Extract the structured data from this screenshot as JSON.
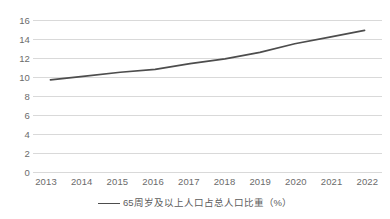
{
  "chart_data": {
    "type": "line",
    "title": "",
    "subtitle": "",
    "xlabel": "",
    "ylabel": "",
    "categories": [
      "2013",
      "2014",
      "2015",
      "2016",
      "2017",
      "2018",
      "2019",
      "2020",
      "2021",
      "2022"
    ],
    "series": [
      {
        "name": "65周岁及以上人口占总人口比重（%）",
        "values": [
          9.7,
          10.1,
          10.5,
          10.8,
          11.4,
          11.9,
          12.6,
          13.5,
          14.2,
          14.9
        ],
        "color": "#4d4d4d"
      }
    ],
    "ylim": [
      0,
      16
    ],
    "y_ticks": [
      0,
      2,
      4,
      6,
      8,
      10,
      12,
      14,
      16
    ],
    "y_tick_labels": [
      "0",
      "2",
      "4",
      "6",
      "8",
      "10",
      "12",
      "14",
      "16"
    ],
    "grid": true,
    "grid_color": "#d9d9d9",
    "legend_position": "bottom",
    "legend_entries": [
      "65周岁及以上人口占总人口比重（%）"
    ],
    "annotations": [],
    "background_color": "#ffffff",
    "axis_text_color": "#6b6b6b"
  }
}
